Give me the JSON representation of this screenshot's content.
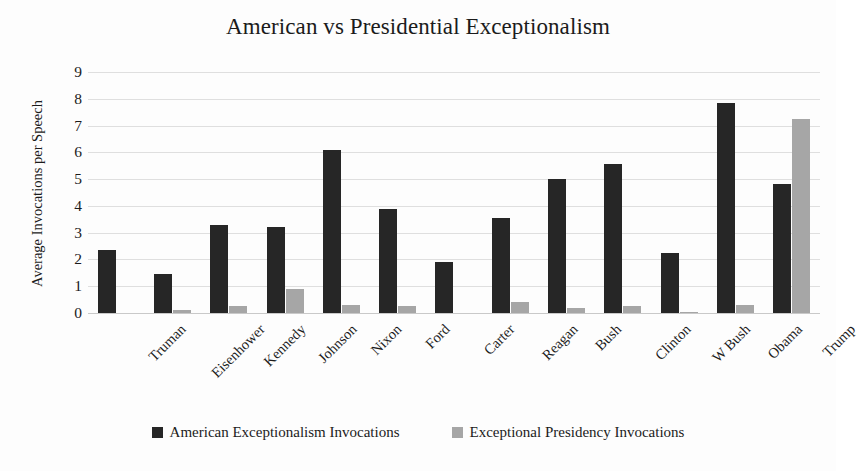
{
  "chart_data": {
    "type": "bar",
    "title": "American vs Presidential Exceptionalism",
    "xlabel": "",
    "ylabel": "Average Invocations per Speech",
    "ylim": [
      0,
      9
    ],
    "ytick_values": [
      9,
      8,
      7,
      6,
      5,
      4,
      3,
      2,
      1,
      0
    ],
    "ytick_labels": [
      "9",
      "8",
      "7",
      "6",
      "5",
      "4",
      "3",
      "2",
      "1",
      "0"
    ],
    "grid": true,
    "legend_position": "bottom",
    "categories": [
      "Truman",
      "Eisenhower",
      "Kennedy",
      "Johnson",
      "Nixon",
      "Ford",
      "Carter",
      "Reagan",
      "Bush",
      "Clinton",
      "W Bush",
      "Obama",
      "Trump"
    ],
    "series": [
      {
        "name": "American Exceptionalism Invocations",
        "color": "#262626",
        "values": [
          2.35,
          1.45,
          3.3,
          3.2,
          6.1,
          3.9,
          1.9,
          3.55,
          5.0,
          5.55,
          2.25,
          7.85,
          4.8
        ]
      },
      {
        "name": "Exceptional Presidency Invocations",
        "color": "#a6a6a6",
        "values": [
          0.0,
          0.1,
          0.25,
          0.9,
          0.3,
          0.25,
          0.0,
          0.4,
          0.2,
          0.25,
          0.05,
          0.3,
          7.25
        ]
      }
    ]
  },
  "colors": {
    "series_0": "#262626",
    "series_1": "#a6a6a6",
    "gridline": "#d9d9d9",
    "background": "#fdfdfd",
    "text": "#1b1b1b"
  }
}
